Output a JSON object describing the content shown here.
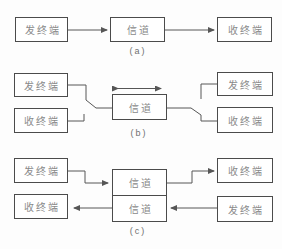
{
  "colors": {
    "line": "#565656",
    "border": "#4b4b4b",
    "text": "#8a8a8a",
    "caption": "#6f6f6f",
    "background": "#fdfdfd",
    "box_fill": "#ffffff"
  },
  "sections": {
    "a": {
      "caption": "(a)",
      "send": "发终端",
      "channel": "信道",
      "receive": "收终端"
    },
    "b": {
      "caption": "(b)",
      "left_send": "发终端",
      "left_receive": "收终端",
      "channel": "信道",
      "right_send": "发终端",
      "right_receive": "收终端"
    },
    "c": {
      "caption": "(c)",
      "left_send": "发终端",
      "left_receive": "收终端",
      "channel_forward": "信道",
      "channel_reverse": "信道",
      "right_receive": "收终端",
      "right_send": "发终端"
    }
  }
}
